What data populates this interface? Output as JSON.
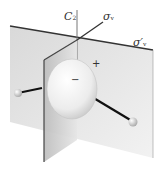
{
  "diagram": {
    "labels": {
      "c2_axis": {
        "main": "C",
        "sub": "2"
      },
      "sigma_v": {
        "main": "σ",
        "sub": "v"
      },
      "sigma_v_prime": {
        "main": "σ′",
        "sub": "v"
      }
    },
    "orbital_signs": {
      "positive": "+",
      "negative": "−"
    }
  }
}
